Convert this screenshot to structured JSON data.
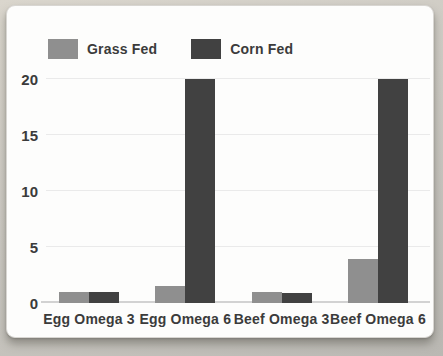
{
  "legend": {
    "items": [
      {
        "label": "Grass Fed",
        "color": "#8f8f8f"
      },
      {
        "label": "Corn Fed",
        "color": "#414141"
      }
    ]
  },
  "chart_data": {
    "type": "bar",
    "categories": [
      "Egg Omega 3",
      "Egg Omega 6",
      "Beef Omega 3",
      "Beef Omega 6"
    ],
    "series": [
      {
        "name": "Grass Fed",
        "color": "#8f8f8f",
        "values": [
          1,
          1.5,
          1,
          3.9
        ]
      },
      {
        "name": "Corn Fed",
        "color": "#414141",
        "values": [
          1,
          20,
          0.9,
          20
        ]
      }
    ],
    "title": "",
    "xlabel": "",
    "ylabel": "",
    "ylim": [
      0,
      20
    ],
    "yticks": [
      0,
      5,
      10,
      15,
      20
    ],
    "grid": true,
    "legend_position": "top-left"
  },
  "colors": {
    "grass_fed": "#8f8f8f",
    "corn_fed": "#414141",
    "text": "#3b3b3b",
    "gridline": "#eaeaea",
    "axis_line": "#d2d2d2",
    "card_background": "#fdfdfc",
    "page_background": "#cdcac3"
  }
}
